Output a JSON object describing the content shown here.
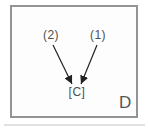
{
  "panel": {
    "panel_label": "D",
    "background_color": "#fdfdfd",
    "border_color": "#949494"
  },
  "diagram": {
    "type": "node-arrow-diagram",
    "nodes": [
      {
        "id": "source-2",
        "label": "(2)"
      },
      {
        "id": "source-1",
        "label": "(1)"
      },
      {
        "id": "target-c",
        "label": "[C]"
      }
    ],
    "edges": [
      {
        "from": "(2)",
        "to": "[C]",
        "style": "solid-arrow"
      },
      {
        "from": "(1)",
        "to": "[C]",
        "style": "solid-arrow"
      }
    ],
    "arrow_color": "#222222",
    "label_color": "#4f4f4f"
  }
}
